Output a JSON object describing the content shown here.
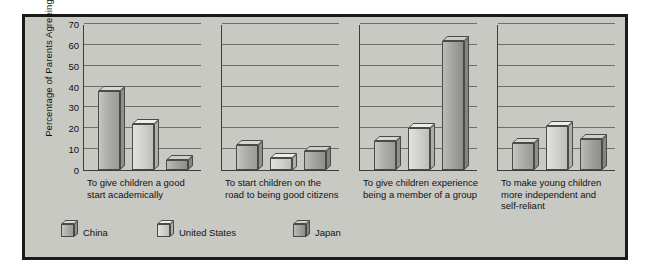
{
  "chart_data": {
    "type": "bar",
    "title": "",
    "xlabel": "",
    "ylabel": "Percentage of Parents Agreeing",
    "ylim": [
      0,
      70
    ],
    "ytick_step": 10,
    "yticks": [
      0,
      10,
      20,
      30,
      40,
      50,
      60,
      70
    ],
    "grid": true,
    "legend_position": "bottom-left",
    "categories": [
      "To give children a good start academically",
      "To start children on the road to being good citizens",
      "To give children experience being a member of a group",
      "To make young children more independent and self-reliant"
    ],
    "category_lines": [
      [
        "To give children a good",
        "start academically"
      ],
      [
        "To start children on the",
        "road to being good citizens"
      ],
      [
        "To give children experience",
        "being a member of a group"
      ],
      [
        "To make young children",
        "more independent and",
        "self-reliant"
      ]
    ],
    "series": [
      {
        "name": "China",
        "color": "#a9a9a5",
        "values": [
          38,
          12,
          14,
          13
        ]
      },
      {
        "name": "United States",
        "color": "#cfcfcb",
        "values": [
          22,
          6,
          20,
          21
        ]
      },
      {
        "name": "Japan",
        "color": "#9f9f9b",
        "values": [
          5,
          9,
          62,
          15
        ]
      }
    ]
  },
  "legend": {
    "items": [
      {
        "label": "China"
      },
      {
        "label": "United States"
      },
      {
        "label": "Japan"
      }
    ]
  },
  "axis": {
    "y_title": "Percentage of Parents Agreeing",
    "tick_labels": [
      "70",
      "60",
      "50",
      "40",
      "30",
      "20",
      "10",
      "0"
    ]
  }
}
